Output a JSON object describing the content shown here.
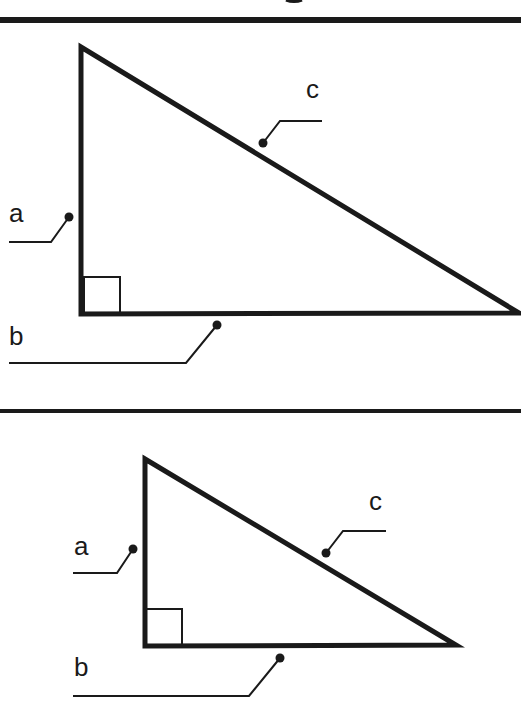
{
  "colors": {
    "ink": "#1a1a1a",
    "background": "#ffffff"
  },
  "dividers": [
    {
      "y": 20,
      "thickness": 6
    },
    {
      "y": 411,
      "thickness": 4
    }
  ],
  "diagrams": [
    {
      "name": "right-triangle-large",
      "vertices": {
        "top": [
          81,
          47
        ],
        "right_angle": [
          81,
          314
        ],
        "right": [
          519,
          313
        ]
      },
      "right_angle_box": {
        "x": 84,
        "y": 277,
        "size": 36
      },
      "labels": {
        "a": {
          "text": "a",
          "x": 9,
          "y": 222,
          "dot": [
            69,
            217
          ],
          "elbow": [
            51,
            242
          ],
          "end": [
            9,
            242
          ]
        },
        "b": {
          "text": "b",
          "x": 9,
          "y": 345,
          "dot": [
            217,
            325
          ],
          "elbow": [
            186,
            363
          ],
          "end": [
            9,
            363
          ]
        },
        "c": {
          "text": "c",
          "x": 306,
          "y": 98,
          "dot": [
            263,
            143
          ],
          "elbow": [
            280,
            121
          ],
          "end": [
            322,
            121
          ]
        }
      }
    },
    {
      "name": "right-triangle-small",
      "vertices": {
        "top": [
          145,
          459
        ],
        "right_angle": [
          145,
          646
        ],
        "right": [
          456,
          645
        ]
      },
      "right_angle_box": {
        "x": 146,
        "y": 609,
        "size": 36
      },
      "labels": {
        "a": {
          "text": "a",
          "x": 74,
          "y": 555,
          "dot": [
            133,
            549
          ],
          "elbow": [
            117,
            573
          ],
          "end": [
            73,
            573
          ]
        },
        "b": {
          "text": "b",
          "x": 74,
          "y": 676,
          "dot": [
            280,
            658
          ],
          "elbow": [
            249,
            696
          ],
          "end": [
            73,
            696
          ]
        },
        "c": {
          "text": "c",
          "x": 369,
          "y": 510,
          "dot": [
            326,
            553
          ],
          "elbow": [
            343,
            531
          ],
          "end": [
            386,
            531
          ]
        }
      }
    }
  ]
}
